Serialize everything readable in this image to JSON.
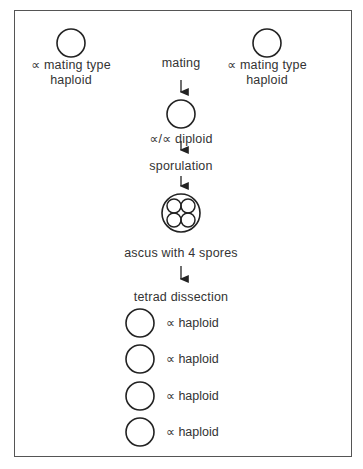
{
  "diagram": {
    "parents": [
      {
        "line1": "∝ mating  type",
        "line2": "haploid"
      },
      {
        "line1": "∝ mating  type",
        "line2": "haploid"
      }
    ],
    "steps": {
      "mating": "mating",
      "diploid": "∝/∝ diploid",
      "sporulation": "sporulation",
      "ascus": "ascus with 4 spores",
      "tetrad": "tetrad dissection"
    },
    "spores": [
      {
        "label": "∝ haploid"
      },
      {
        "label": "∝ haploid"
      },
      {
        "label": "∝ haploid"
      },
      {
        "label": "∝ haploid"
      }
    ],
    "colors": {
      "stroke": "#222222",
      "frame": "#555555",
      "text": "#333333"
    }
  }
}
